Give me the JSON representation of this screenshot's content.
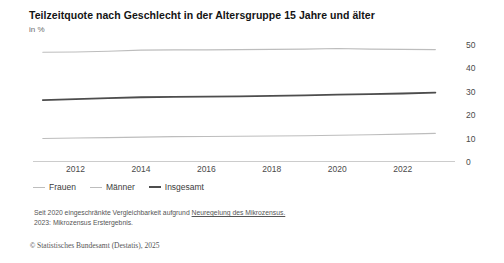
{
  "header": {
    "title": "Teilzeitquote nach Geschlecht in der Altersgruppe 15 Jahre und älter",
    "subtitle": "in %"
  },
  "footnotes": {
    "line1_prefix": "Seit 2020 eingeschränkte Vergleichbarkeit aufgrund ",
    "line1_link": "Neuregelung des Mikrozensus.",
    "line2": "2023: Mikrozensus Erstergebnis."
  },
  "source": {
    "mark": "©",
    "text": "Statistisches Bundesamt (Destatis), 2025"
  },
  "colors": {
    "frauen": "#bdbdbd",
    "maenner": "#bdbdbd",
    "insgesamt": "#4d4d4d",
    "axis": "#8c8c8c",
    "tick_label": "#4a4a4a"
  },
  "chart_data": {
    "type": "line",
    "title": "Teilzeitquote nach Geschlecht in der Altersgruppe 15 Jahre und älter",
    "subtitle": "in %",
    "xlabel": "",
    "ylabel": "in %",
    "x": [
      2011,
      2012,
      2013,
      2014,
      2015,
      2016,
      2017,
      2018,
      2019,
      2020,
      2021,
      2022,
      2023
    ],
    "xtick_labels": [
      "2012",
      "2014",
      "2016",
      "2018",
      "2020",
      "2022"
    ],
    "xticks": [
      2012,
      2014,
      2016,
      2018,
      2020,
      2022
    ],
    "xlim": [
      2010.7,
      2023.6
    ],
    "ylim": [
      0,
      52
    ],
    "yticks": [
      0,
      10,
      20,
      30,
      40,
      50
    ],
    "ytick_labels": [
      "0",
      "10",
      "20",
      "30",
      "40",
      "50"
    ],
    "grid": false,
    "legend_position": "bottom-left",
    "series": [
      {
        "name": "Frauen",
        "color": "#bdbdbd",
        "width": 1.1,
        "values": [
          46.8,
          46.9,
          47.2,
          47.7,
          47.8,
          47.8,
          47.9,
          48.0,
          48.1,
          48.4,
          48.1,
          48.0,
          47.9
        ]
      },
      {
        "name": "Männer",
        "color": "#bdbdbd",
        "width": 1.1,
        "values": [
          10.0,
          10.2,
          10.4,
          10.6,
          10.8,
          10.9,
          11.0,
          11.1,
          11.2,
          11.4,
          11.6,
          11.9,
          12.2
        ]
      },
      {
        "name": "Insgesamt",
        "color": "#4d4d4d",
        "width": 1.8,
        "values": [
          26.4,
          26.8,
          27.2,
          27.6,
          27.8,
          27.9,
          28.0,
          28.2,
          28.4,
          28.7,
          28.9,
          29.2,
          29.6
        ]
      }
    ]
  }
}
